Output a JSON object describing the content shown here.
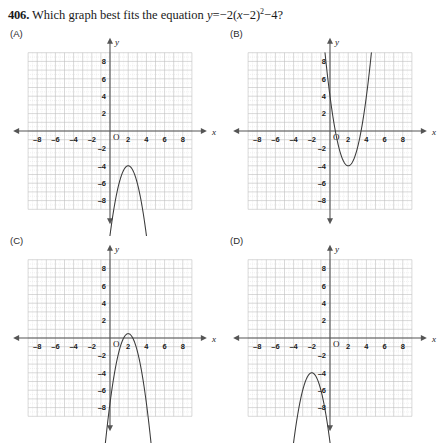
{
  "question": {
    "number": "406.",
    "prompt": "Which graph best fits the equation",
    "equation_plain": "y = −2(x − 2)² − 4?",
    "equation_parts": {
      "lhs": "y",
      "equals": "=",
      "sign": "−",
      "coefficient": "2",
      "open_paren": "(",
      "variable": "x",
      "minus": "−",
      "shift": "2",
      "close_paren": ")",
      "exponent": "2",
      "tail_minus": "−",
      "constant": "4",
      "question_mark": "?"
    }
  },
  "axis": {
    "x_label": "x",
    "y_label": "y",
    "origin_label": "O",
    "x_ticks": [
      "–8",
      "–6",
      "–4",
      "–2",
      "2",
      "4",
      "6",
      "8"
    ],
    "x_tick_values": [
      -8,
      -6,
      -4,
      -2,
      2,
      4,
      6,
      8
    ],
    "y_ticks": [
      "8",
      "6",
      "4",
      "2",
      "–2",
      "–4",
      "–6",
      "–8"
    ],
    "y_tick_values": [
      8,
      6,
      4,
      2,
      -2,
      -4,
      -6,
      -8
    ],
    "xlim": [
      -9,
      9
    ],
    "ylim": [
      -9,
      9
    ],
    "grid_major_step": 1,
    "grid_minor_step": 0.5
  },
  "colors": {
    "background": "#ffffff",
    "text": "#1a1a1a",
    "axis": "#555555",
    "grid_major": "#bfbfbf",
    "grid_minor": "#dedede",
    "curve": "#3a3a3a"
  },
  "panels": [
    {
      "id": "A",
      "label": "(A)",
      "chart_data": {
        "type": "line",
        "title": "(A)",
        "xlabel": "x",
        "ylabel": "y",
        "xlim": [
          -9,
          9
        ],
        "ylim": [
          -9,
          9
        ],
        "grid": true,
        "legend": "none",
        "series": [
          {
            "name": "parabola-a",
            "equation": "y = -2(x - 2)^2 - 4",
            "vertex": [
              2,
              -4
            ],
            "a": -2,
            "opens": "down",
            "x": [
              0.5,
              0.75,
              1,
              1.25,
              1.5,
              1.75,
              2,
              2.25,
              2.5,
              2.75,
              3,
              3.25,
              3.5
            ],
            "values": [
              -8.5,
              -7.125,
              -6,
              -5.125,
              -4.5,
              -4.125,
              -4,
              -4.125,
              -4.5,
              -5.125,
              -6,
              -7.125,
              -8.5
            ]
          }
        ]
      }
    },
    {
      "id": "B",
      "label": "(B)",
      "chart_data": {
        "type": "line",
        "title": "(B)",
        "xlabel": "x",
        "ylabel": "y",
        "xlim": [
          -9,
          9
        ],
        "ylim": [
          -9,
          9
        ],
        "grid": true,
        "legend": "none",
        "series": [
          {
            "name": "parabola-b",
            "equation": "y = 2(x - 2)^2 - 4",
            "vertex": [
              2,
              -4
            ],
            "a": 2,
            "opens": "up",
            "x": [
              -0.5,
              0,
              0.5,
              1,
              1.5,
              2,
              2.5,
              3,
              3.5,
              4,
              4.5
            ],
            "values": [
              8.5,
              4,
              0.5,
              -2,
              -3.5,
              -4,
              -3.5,
              -2,
              0.5,
              4,
              8.5
            ]
          }
        ]
      }
    },
    {
      "id": "C",
      "label": "(C)",
      "chart_data": {
        "type": "line",
        "title": "(C)",
        "xlabel": "x",
        "ylabel": "y",
        "xlim": [
          -9,
          9
        ],
        "ylim": [
          -9,
          9
        ],
        "grid": true,
        "legend": "none",
        "series": [
          {
            "name": "parabola-c",
            "equation": "y = -2(x - 2)^2 + 0.5",
            "vertex": [
              2,
              0.5
            ],
            "a": -2,
            "opens": "down",
            "x": [
              0,
              0.5,
              1,
              1.5,
              2,
              2.5,
              3,
              3.5,
              4
            ],
            "values": [
              -7.5,
              -4,
              -1.5,
              0,
              0.5,
              0,
              -1.5,
              -4,
              -7.5
            ]
          }
        ]
      }
    },
    {
      "id": "D",
      "label": "(D)",
      "chart_data": {
        "type": "line",
        "title": "(D)",
        "xlabel": "x",
        "ylabel": "y",
        "xlim": [
          -9,
          9
        ],
        "ylim": [
          -9,
          9
        ],
        "grid": true,
        "legend": "none",
        "series": [
          {
            "name": "parabola-d",
            "equation": "y = -2(x + 2)^2 - 4",
            "vertex": [
              -2,
              -4
            ],
            "a": -2,
            "opens": "down",
            "x": [
              -3.5,
              -3.25,
              -3,
              -2.75,
              -2.5,
              -2.25,
              -2,
              -1.75,
              -1.5,
              -1.25,
              -1
            ],
            "values": [
              -8.5,
              -7.125,
              -6,
              -5.125,
              -4.5,
              -4.125,
              -4,
              -4.125,
              -4.5,
              -5.125,
              -6
            ]
          }
        ]
      }
    }
  ]
}
